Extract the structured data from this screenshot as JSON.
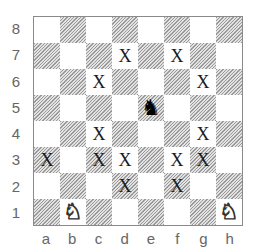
{
  "diagram": {
    "type": "chess-board",
    "files": [
      "a",
      "b",
      "c",
      "d",
      "e",
      "f",
      "g",
      "h"
    ],
    "ranks": [
      "8",
      "7",
      "6",
      "5",
      "4",
      "3",
      "2",
      "1"
    ],
    "pieces": [
      {
        "square": "e5",
        "piece": "knight",
        "color": "black",
        "glyph": "♞"
      },
      {
        "square": "b1",
        "piece": "knight",
        "color": "white",
        "glyph": "♘"
      },
      {
        "square": "h1",
        "piece": "knight",
        "color": "white",
        "glyph": "♘"
      }
    ],
    "marks": {
      "glyph": "X",
      "squares": [
        "d7",
        "f7",
        "c6",
        "g6",
        "c4",
        "g4",
        "a3",
        "c3",
        "d3",
        "f3",
        "g3",
        "d2",
        "f2"
      ]
    }
  }
}
